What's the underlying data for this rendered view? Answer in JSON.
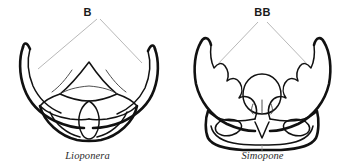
{
  "plate": {
    "background_color": "#ffffff",
    "ink_color": "#111111",
    "leader_color": "#9a9a9a",
    "panels": [
      {
        "id": "left",
        "callout_label": "B",
        "genus_caption": "Lioponera",
        "subject": "ant-head-mandibles-dorsal-view",
        "mandible_form": "smooth-falcate-untoothed"
      },
      {
        "id": "right",
        "callout_label": "BB",
        "genus_caption": "Simopone",
        "subject": "ant-head-mandibles-dorsal-view",
        "mandible_form": "toothed-dentate"
      }
    ]
  }
}
